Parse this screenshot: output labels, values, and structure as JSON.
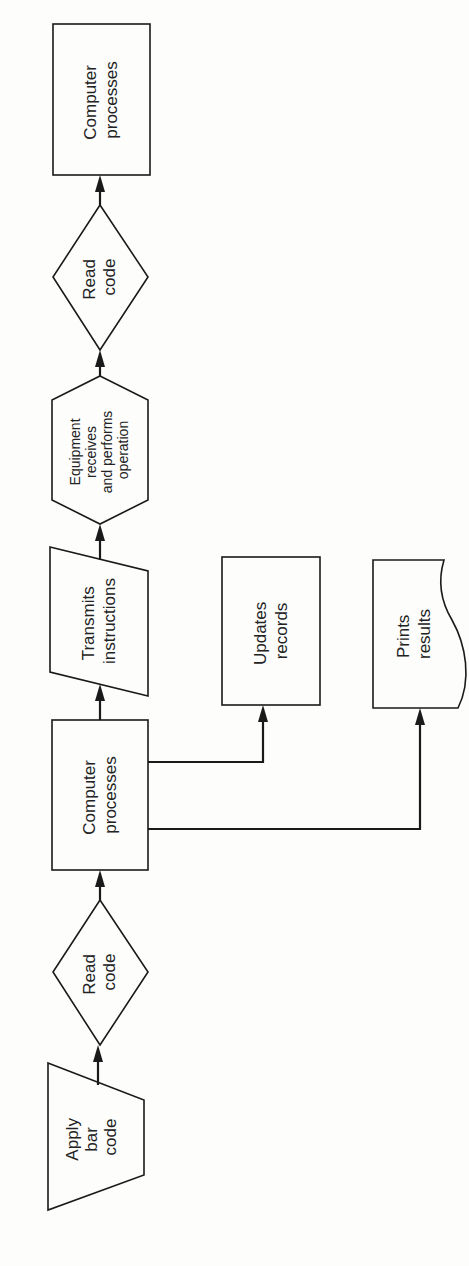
{
  "diagram": {
    "orientation": "rotated -90deg (flow reads bottom to top)",
    "colors": {
      "stroke": "#1a1a1a",
      "text": "#222222",
      "background": "#fdfdfc"
    },
    "nodes": [
      {
        "id": "apply-bar-code",
        "shape": "manual-operation-trapezoid",
        "lines": [
          "Apply",
          "bar",
          "code"
        ]
      },
      {
        "id": "read-code-1",
        "shape": "diamond",
        "lines": [
          "Read",
          "code"
        ]
      },
      {
        "id": "computer-processes-1",
        "shape": "rectangle",
        "lines": [
          "Computer",
          "processes"
        ]
      },
      {
        "id": "transmits-instructions",
        "shape": "parallelogram",
        "lines": [
          "Transmits",
          "instructions"
        ]
      },
      {
        "id": "equipment-operation",
        "shape": "hexagon",
        "lines": [
          "Equipment",
          "receives",
          "and performs",
          "operation"
        ]
      },
      {
        "id": "read-code-2",
        "shape": "diamond",
        "lines": [
          "Read",
          "code"
        ]
      },
      {
        "id": "computer-processes-2",
        "shape": "rectangle",
        "lines": [
          "Computer",
          "processes"
        ]
      },
      {
        "id": "updates-records",
        "shape": "rectangle",
        "lines": [
          "Updates",
          "records"
        ]
      },
      {
        "id": "prints-results",
        "shape": "document",
        "lines": [
          "Prints",
          "results"
        ]
      }
    ],
    "edges": [
      {
        "from": "apply-bar-code",
        "to": "read-code-1"
      },
      {
        "from": "read-code-1",
        "to": "computer-processes-1"
      },
      {
        "from": "computer-processes-1",
        "to": "transmits-instructions"
      },
      {
        "from": "transmits-instructions",
        "to": "equipment-operation"
      },
      {
        "from": "equipment-operation",
        "to": "read-code-2"
      },
      {
        "from": "read-code-2",
        "to": "computer-processes-2"
      },
      {
        "from": "computer-processes-1",
        "to": "updates-records"
      },
      {
        "from": "computer-processes-1",
        "to": "prints-results"
      }
    ]
  }
}
